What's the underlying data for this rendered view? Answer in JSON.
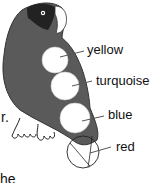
{
  "diagram": {
    "labels": [
      {
        "text": "yellow"
      },
      {
        "text": "turquoise"
      },
      {
        "text": "blue"
      },
      {
        "text": "red"
      }
    ],
    "text_fragments": {
      "left": "r.",
      "bottom": "he"
    }
  }
}
